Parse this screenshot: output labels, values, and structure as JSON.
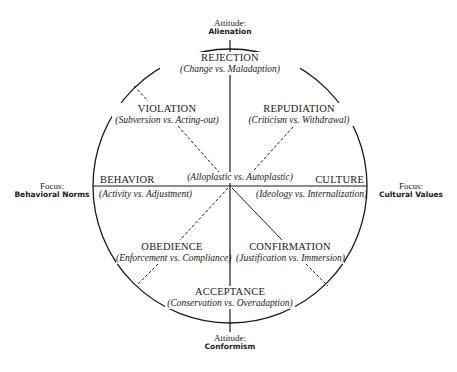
{
  "diagram": {
    "axes": {
      "top": {
        "heading": "Attitude:",
        "value": "Alienation"
      },
      "bottom": {
        "heading": "Attitude:",
        "value": "Conformism"
      },
      "left": {
        "heading": "Focus:",
        "value": "Behavioral Norms"
      },
      "right": {
        "heading": "Focus:",
        "value": "Cultural Values"
      }
    },
    "poles": {
      "rejection": {
        "title": "REJECTION",
        "sub": "(Change vs. Maladaption)"
      },
      "acceptance": {
        "title": "ACCEPTANCE",
        "sub": "(Conservation vs. Overadaption)"
      },
      "behavior": {
        "title": "BEHAVIOR",
        "sub": "(Activity vs. Adjustment)"
      },
      "culture": {
        "title": "CULTURE",
        "sub": "(Ideology vs. Internalization)"
      }
    },
    "quadrants": {
      "violation": {
        "title": "VIOLATION",
        "sub": "(Subversion vs. Acting-out)"
      },
      "repudiation": {
        "title": "REPUDIATION",
        "sub": "(Criticism vs. Withdrawal)"
      },
      "obedience": {
        "title": "OBEDIENCE",
        "sub": "(Enforcement vs. Compliance)"
      },
      "confirmation": {
        "title": "CONFIRMATION",
        "sub": "(Justification vs. Immersion)"
      }
    },
    "center": {
      "label": "(Alloplastic vs. Autoplastic)"
    },
    "colors": {
      "ink": "#1a1a1a",
      "background": "#ffffff"
    }
  }
}
